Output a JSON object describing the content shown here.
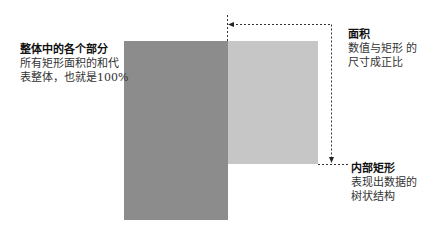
{
  "diagram": {
    "type": "treemap-explanation",
    "colors": {
      "outer_rect": "#8c8c8c",
      "inner_rect": "#c6c6c6",
      "guide_lines": "#333333",
      "background": "#ffffff"
    },
    "annotations": {
      "whole": {
        "title": "整体中的各个部分",
        "line1": "所有矩形面积的和代",
        "line2": "表整体，也就是100%"
      },
      "area": {
        "title": "面积",
        "line1": "数值与矩形 的",
        "line2": "尺寸成正比"
      },
      "inner": {
        "title": "内部矩形",
        "line1": "表现出数据的",
        "line2": "树状结构"
      }
    }
  }
}
